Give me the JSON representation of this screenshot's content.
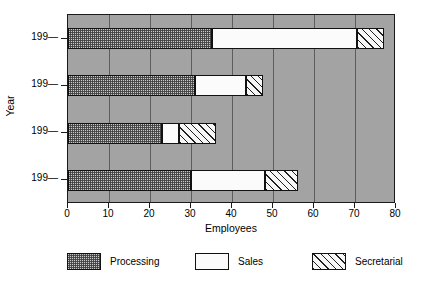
{
  "chart_data": {
    "type": "bar",
    "orientation": "horizontal",
    "stacked": true,
    "title": "",
    "xlabel": "Employees",
    "ylabel": "Year",
    "categories": [
      "199—",
      "199—",
      "199—",
      "199—"
    ],
    "series": [
      {
        "name": "Processing",
        "values": [
          35,
          31,
          23,
          30
        ]
      },
      {
        "name": "Sales",
        "values": [
          35.5,
          12.5,
          4,
          18
        ]
      },
      {
        "name": "Secretarial",
        "values": [
          6.5,
          4,
          9,
          8
        ]
      }
    ],
    "cumulative_totals": [
      77,
      47.5,
      36,
      56
    ],
    "xlim": [
      0,
      80
    ],
    "xticks": [
      0,
      10,
      20,
      30,
      40,
      50,
      60,
      70,
      80
    ],
    "xtick_labels": [
      "0",
      "10",
      "20",
      "30",
      "40",
      "50",
      "60",
      "70",
      "80"
    ],
    "grid": "vertical",
    "legend_position": "bottom",
    "plot_background": "#a3a3a3"
  },
  "axes": {
    "x_title": "Employees",
    "y_title": "Year",
    "x_tick_labels": [
      "0",
      "10",
      "20",
      "30",
      "40",
      "50",
      "60",
      "70",
      "80"
    ],
    "y_tick_labels": [
      "199—",
      "199—",
      "199—",
      "199—"
    ]
  },
  "legend": {
    "items": [
      {
        "label": "Processing",
        "pattern": "stipple",
        "color": "#c9c9c9"
      },
      {
        "label": "Sales",
        "pattern": "solid",
        "color": "#fbfbfb"
      },
      {
        "label": "Secretarial",
        "pattern": "diagonal-hatch",
        "color": "#f7f7f7"
      }
    ]
  },
  "colors": {
    "plot_background": "#a3a3a3",
    "gridline": "#5d5d5d",
    "axis": "#1a1a1a",
    "text": "#000000",
    "page_background": "#ffffff"
  }
}
